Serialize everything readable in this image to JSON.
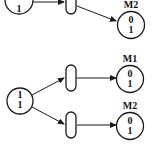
{
  "diagram": {
    "type": "petri-net",
    "top_net": {
      "source_place": {
        "tokens": [
          "1"
        ]
      },
      "target_place": {
        "label": "M2",
        "tokens": [
          "0",
          "1"
        ]
      }
    },
    "bottom_net": {
      "source_place": {
        "tokens": [
          "1",
          "1"
        ]
      },
      "upper_target": {
        "label": "M1",
        "tokens": [
          "0",
          "1"
        ]
      },
      "lower_target": {
        "label": "M2",
        "tokens": [
          "0",
          "1"
        ]
      }
    }
  },
  "colors": {
    "stroke": "#1a1a1a",
    "background": "#ffffff"
  }
}
